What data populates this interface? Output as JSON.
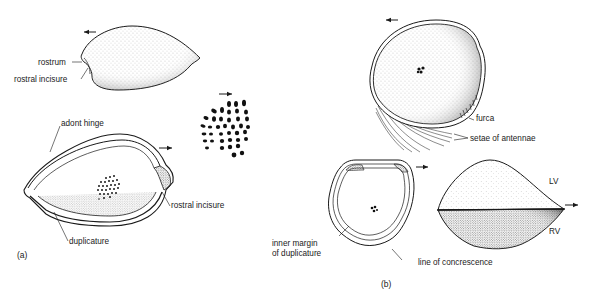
{
  "figure": {
    "panels": [
      {
        "id": "a",
        "label": "(a)",
        "views": [
          {
            "name": "lateral-exterior",
            "labels": {
              "rostrum": "rostrum",
              "rostral_incisure": "rostral incisure"
            }
          },
          {
            "name": "interior",
            "labels": {
              "adont_hinge": "adont hinge",
              "rostral_incisure": "rostral incisure",
              "duplicature": "duplicature"
            }
          },
          {
            "name": "muscle-scars-enlarged"
          }
        ]
      },
      {
        "id": "b",
        "label": "(b)",
        "views": [
          {
            "name": "lateral-with-appendages",
            "labels": {
              "furca": "furca",
              "setae_of_antennae": "setae of antennae"
            }
          },
          {
            "name": "interior",
            "labels": {
              "inner_margin_line1": "inner margin",
              "inner_margin_line2": "of duplicature",
              "line_of_concrescence": "line of concrescence"
            }
          },
          {
            "name": "dorsal",
            "labels": {
              "lv": "LV",
              "rv": "RV"
            }
          }
        ]
      }
    ]
  },
  "colors": {
    "ink": "#1a1a1a",
    "background": "#ffffff"
  }
}
